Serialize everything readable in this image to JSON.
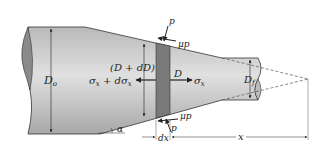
{
  "diagram": {
    "labels": {
      "D_o": "D",
      "D_o_sub": "o",
      "D_f": "D",
      "D_f_sub": "f",
      "D_plus_dD": "(D + dD)",
      "D": "D",
      "sigma_left": "σ",
      "sigma_left_sub": "x",
      "sigma_left_rest": " + dσ",
      "sigma_left_rest_sub": "x",
      "sigma_right": "σ",
      "sigma_right_sub": "x",
      "p_top": "p",
      "mu_p_top": "μp",
      "p_bottom": "p",
      "mu_p_bottom": "μp",
      "alpha": "α",
      "dx": "dx",
      "x": "x"
    },
    "colors": {
      "body_light": "#d4d4d4",
      "body_dark": "#a9a9a9",
      "element_strip": "#7a7a7a",
      "end_face": "#8a8a8a",
      "line": "#222222",
      "dashed": "#555555"
    }
  }
}
